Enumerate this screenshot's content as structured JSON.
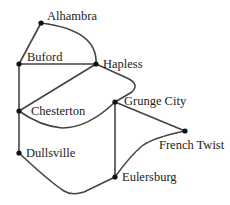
{
  "diagram": {
    "type": "graph",
    "colors": {
      "edge": "#444444",
      "node": "#111111",
      "text": "#222222",
      "background": "#ffffff"
    },
    "nodes": [
      {
        "id": "alhambra",
        "label": "Alhambra",
        "x": 41,
        "y": 23
      },
      {
        "id": "buford",
        "label": "Buford",
        "x": 19,
        "y": 64
      },
      {
        "id": "hapless",
        "label": "Hapless",
        "x": 96,
        "y": 64
      },
      {
        "id": "chesterton",
        "label": "Chesterton",
        "x": 19,
        "y": 111
      },
      {
        "id": "grunge_city",
        "label": "Grunge City",
        "x": 115,
        "y": 102
      },
      {
        "id": "french_twist",
        "label": "French Twist",
        "x": 185,
        "y": 131
      },
      {
        "id": "dullsville",
        "label": "Dullsville",
        "x": 19,
        "y": 153
      },
      {
        "id": "eulersburg",
        "label": "Eulersburg",
        "x": 115,
        "y": 177
      }
    ],
    "edges": [
      [
        "Alhambra",
        "Buford"
      ],
      [
        "Alhambra",
        "Hapless"
      ],
      [
        "Buford",
        "Hapless"
      ],
      [
        "Buford",
        "Chesterton"
      ],
      [
        "Hapless",
        "Chesterton"
      ],
      [
        "Hapless",
        "Grunge City"
      ],
      [
        "Grunge City",
        "Chesterton"
      ],
      [
        "Chesterton",
        "Dullsville"
      ],
      [
        "Grunge City",
        "Eulersburg"
      ],
      [
        "Grunge City",
        "French Twist"
      ],
      [
        "French Twist",
        "Eulersburg"
      ],
      [
        "Dullsville",
        "Eulersburg"
      ]
    ]
  }
}
